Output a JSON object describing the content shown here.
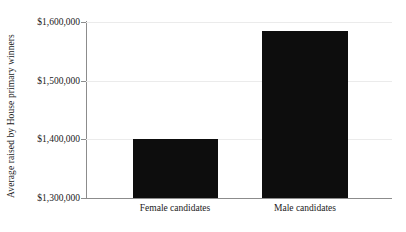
{
  "chart_data": {
    "type": "bar",
    "title": "",
    "subtitle": "",
    "xlabel": "",
    "ylabel": "Average raised by House primary winners",
    "categories": [
      "Female candidates",
      "Male candidates"
    ],
    "values": [
      1400000,
      1585000
    ],
    "series": [
      {
        "name": "Average raised",
        "values": [
          1400000,
          1585000
        ]
      }
    ],
    "ylim": [
      1300000,
      1600000
    ],
    "yticks": [
      1300000,
      1400000,
      1500000,
      1600000
    ],
    "ytick_labels": [
      "$1,300,000",
      "$1,400,000",
      "$1,500,000",
      "$1,600,000"
    ],
    "xtick_labels": [
      "Female candidates",
      "Male candidates"
    ],
    "grid": true,
    "grid_axis": "y",
    "legend": false,
    "legend_position": "none",
    "bar_color": "#0d0d0d",
    "gridline_color": "#ebebeb",
    "axis_color": "#8c8c8c",
    "text_color": "#1a1a1a",
    "background_color": "#ffffff",
    "annotations": []
  },
  "axes": {
    "y_title": "Average raised by House primary winners",
    "y_ticks": [
      {
        "label": "$1,600,000",
        "value": 1600000
      },
      {
        "label": "$1,500,000",
        "value": 1500000
      },
      {
        "label": "$1,400,000",
        "value": 1400000
      },
      {
        "label": "$1,300,000",
        "value": 1300000
      }
    ],
    "x_ticks": [
      {
        "label": "Female candidates"
      },
      {
        "label": "Male candidates"
      }
    ]
  },
  "bars": [
    {
      "category": "Female candidates",
      "value": 1400000
    },
    {
      "category": "Male candidates",
      "value": 1585000
    }
  ]
}
